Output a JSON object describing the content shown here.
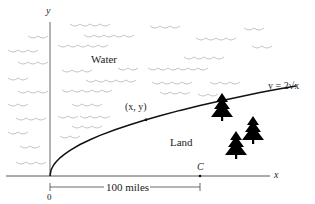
{
  "figure": {
    "axes": {
      "x_label": "x",
      "y_label": "y",
      "origin_label": "0"
    },
    "regions": {
      "water_label": "Water",
      "land_label": "Land"
    },
    "curve": {
      "equation_label": "y = 2√x",
      "point_label": "(x, y)"
    },
    "point_c_label": "C",
    "distance_label": "100 miles",
    "colors": {
      "curve": "#111111",
      "axis": "#333333",
      "waves": "#bbbbbb",
      "trees": "#000000"
    }
  }
}
